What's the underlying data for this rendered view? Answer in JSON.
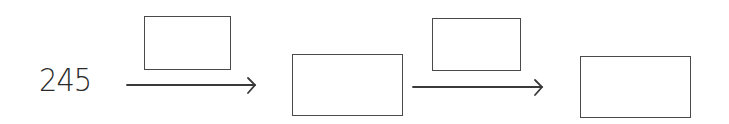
{
  "diagram": {
    "type": "operation-chain",
    "start_value": "245",
    "operator_boxes": [
      {
        "id": "operator-1",
        "value": ""
      },
      {
        "id": "operator-2",
        "value": ""
      }
    ],
    "result_boxes": [
      {
        "id": "result-1",
        "value": ""
      },
      {
        "id": "result-2",
        "value": ""
      }
    ],
    "colors": {
      "stroke": "#4a4a4a",
      "text": "#2a2a2a",
      "background": "#ffffff"
    }
  }
}
